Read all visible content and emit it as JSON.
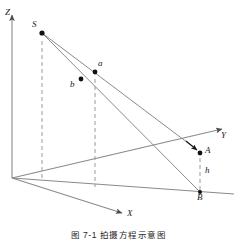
{
  "figure": {
    "caption": "图 7-1   拍摄方程示意图",
    "caption_number": "图 7-1",
    "caption_title": "拍摄方程示意图",
    "type": "3d-coordinate-geometry-diagram",
    "colors": {
      "line": "#8a8a8a",
      "dashed": "#9a9a9a",
      "point": "#111111",
      "text": "#1a1a1a",
      "background": "#ffffff"
    }
  },
  "axes": [
    {
      "key": "z",
      "label": "Z",
      "label_x": 6,
      "label_y": 9,
      "direction": "up"
    },
    {
      "key": "y",
      "label": "Y",
      "label_x": 221,
      "label_y": 132,
      "direction": "upper-right"
    },
    {
      "key": "x",
      "label": "X",
      "label_x": 127,
      "label_y": 210,
      "direction": "lower-right"
    }
  ],
  "points": [
    {
      "key": "S",
      "label": "S",
      "x": 42,
      "y": 33,
      "label_x": 32,
      "label_y": 21,
      "description": "camera perspective center"
    },
    {
      "key": "a",
      "label": "a",
      "x": 95,
      "y": 72,
      "label_x": 98,
      "label_y": 60,
      "description": "image point a"
    },
    {
      "key": "b",
      "label": "b",
      "x": 81,
      "y": 79,
      "label_x": 70,
      "label_y": 81,
      "description": "image point b"
    },
    {
      "key": "A",
      "label": "A",
      "x": 200,
      "y": 153,
      "label_x": 205,
      "label_y": 146,
      "description": "ground object point A"
    },
    {
      "key": "B",
      "label": "B",
      "x": 200,
      "y": 192,
      "label_x": 197,
      "label_y": 194,
      "description": "ground projection point B"
    }
  ],
  "measures": [
    {
      "key": "h",
      "label": "h",
      "label_x": 205,
      "label_y": 167,
      "from": "A",
      "to": "B",
      "description": "height of A above ground line"
    }
  ],
  "dashed_lines": [
    {
      "key": "s-drop",
      "from_x": 42,
      "from_y": 40,
      "to_x": 42,
      "to_y": 181
    },
    {
      "key": "a-drop",
      "from_x": 95,
      "from_y": 78,
      "to_x": 95,
      "to_y": 186
    },
    {
      "key": "ab-height",
      "from_x": 200,
      "from_y": 157,
      "to_x": 200,
      "to_y": 191
    }
  ],
  "rays": [
    {
      "key": "S-to-B",
      "from": "S",
      "to": "B"
    },
    {
      "key": "S-to-A",
      "from": "S",
      "to": "A"
    },
    {
      "key": "O-to-Y",
      "from": "origin",
      "to": "Y-axis"
    },
    {
      "key": "O-to-B",
      "from": "origin",
      "to": "ground-line"
    }
  ],
  "origin": {
    "x": 12,
    "y": 178,
    "label": "O"
  }
}
